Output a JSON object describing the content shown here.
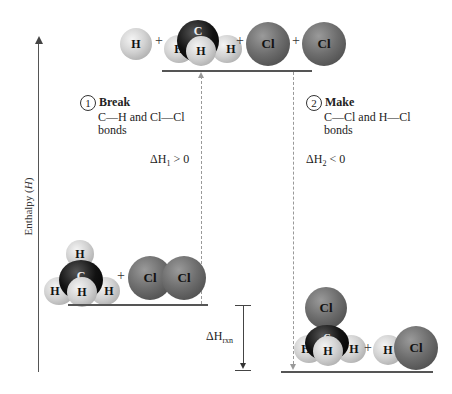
{
  "axis": {
    "label": "Enthalpy (H)",
    "label_prefix": "Enthalpy (",
    "label_var": "H",
    "label_suffix": ")"
  },
  "top_state": {
    "atoms": [
      "H",
      "C",
      "H",
      "H",
      "H",
      "Cl",
      "Cl"
    ],
    "plus": "+"
  },
  "left_state": {
    "atoms": [
      "H",
      "C",
      "H",
      "H",
      "H",
      "Cl",
      "Cl"
    ],
    "plus": "+"
  },
  "right_state": {
    "atoms": [
      "Cl",
      "C",
      "H",
      "H",
      "H",
      "H",
      "Cl"
    ],
    "plus": "+"
  },
  "step1": {
    "number": "1",
    "title": "Break",
    "line1": "C—H and Cl—Cl",
    "line2": "bonds",
    "delta_prefix": "ΔH",
    "delta_sub": "1",
    "delta_suffix": " > 0"
  },
  "step2": {
    "number": "2",
    "title": "Make",
    "line1": "C—Cl and H—Cl",
    "line2": "bonds",
    "delta_prefix": "ΔH",
    "delta_sub": "2",
    "delta_suffix": " < 0"
  },
  "rxn": {
    "delta_prefix": "ΔH",
    "delta_sub": "rxn"
  },
  "colors": {
    "level_line": "#555555",
    "dashed": "#999999",
    "chlorine": "#6e6e6e",
    "hydrogen": "#d2d2d2",
    "carbon": "#111111"
  }
}
